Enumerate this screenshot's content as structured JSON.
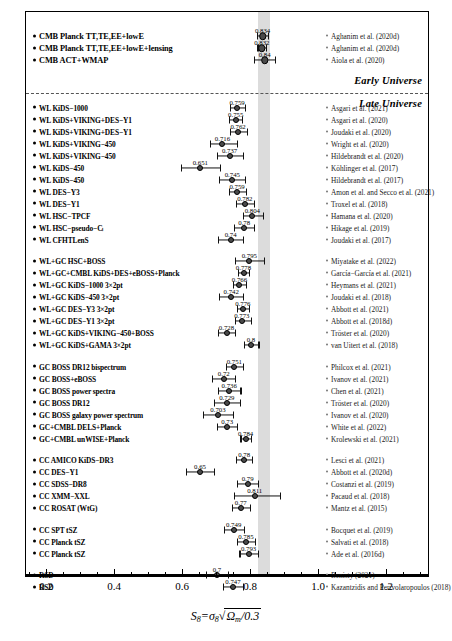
{
  "figure": {
    "xlabel_main": "S",
    "xlabel_sub": "8",
    "xlabel_eq": "=",
    "xlabel_sigma": "σ",
    "xlabel_sigma_sub": "8",
    "xlabel_radicand": "Ω",
    "xlabel_radicand_sub": "m",
    "xlabel_radicand_rest": "/0.3",
    "era_early": "Early Universe",
    "era_late": "Late Universe",
    "band_label": "CMB Planck band",
    "band_color": "#cfcfcf"
  },
  "axis": {
    "labels": [
      "0.2",
      "0.4",
      "0.6",
      "0.8",
      "1.0",
      "1.2"
    ],
    "values": [
      0.2,
      0.4,
      0.6,
      0.8,
      1.0,
      1.2
    ],
    "min": 0.13,
    "max": 1.32,
    "minor_step": 0.05
  },
  "chart_data": {
    "type": "scatter",
    "title": "",
    "xlabel": "S8 = sigma8 sqrt(Omega_m/0.3)",
    "ylabel": "",
    "xlim": [
      0.13,
      1.32
    ],
    "grid": false,
    "legend": "none",
    "band": {
      "low": 0.82,
      "high": 0.855
    },
    "groups": [
      {
        "name": "CMB",
        "era": "early",
        "points": [
          {
            "label": "CMB Planck TT,TE,EE+lowE",
            "value": 0.834,
            "value_text": "0.834",
            "err_low": 0.016,
            "err_high": 0.016,
            "ref": "Aghanim et al. (2020d)"
          },
          {
            "label": "CMB Planck TT,TE,EE+lowE+lensing",
            "value": 0.832,
            "value_text": "0.832",
            "err_low": 0.013,
            "err_high": 0.013,
            "ref": "Aghanim et al. (2020d)"
          },
          {
            "label": "CMB ACT+WMAP",
            "value": 0.84,
            "value_text": "0.84",
            "err_low": 0.03,
            "err_high": 0.03,
            "ref": "Aiola et al. (2020)"
          }
        ]
      },
      {
        "name": "WL",
        "era": "late",
        "points": [
          {
            "label": "WL KiDS−1000",
            "value": 0.759,
            "value_text": "0.759",
            "err_low": 0.021,
            "err_high": 0.024,
            "ref": "Asgari et al. (2021)"
          },
          {
            "label": "WL KiDS+VIKING+DES−Y1",
            "value": 0.755,
            "value_text": "0.755",
            "err_low": 0.021,
            "err_high": 0.019,
            "ref": "Asgari et al. (2020)"
          },
          {
            "label": "WL KiDS+VIKING+DES−Y1",
            "value": 0.762,
            "value_text": "0.762",
            "err_low": 0.024,
            "err_high": 0.025,
            "ref": "Joudaki et al. (2020)"
          },
          {
            "label": "WL KiDS+VIKING−450",
            "value": 0.716,
            "value_text": "0.716",
            "err_low": 0.038,
            "err_high": 0.043,
            "ref": "Wright et al. (2020)"
          },
          {
            "label": "WL KiDS+VIKING−450",
            "value": 0.737,
            "value_text": "0.737",
            "err_low": 0.036,
            "err_high": 0.04,
            "ref": "Hildebrandt et al. (2020)"
          },
          {
            "label": "WL KiDS−450",
            "value": 0.651,
            "value_text": "0.651",
            "err_low": 0.058,
            "err_high": 0.058,
            "ref": "Köhlinger et al. (2017)"
          },
          {
            "label": "WL KiDS−450",
            "value": 0.745,
            "value_text": "0.745",
            "err_low": 0.038,
            "err_high": 0.038,
            "ref": "Hildebrandt et al. (2017)"
          },
          {
            "label": "WL DES−Y3",
            "value": 0.759,
            "value_text": "0.759",
            "err_low": 0.023,
            "err_high": 0.025,
            "ref": "Amon et al. and Secco et al. (2021)"
          },
          {
            "label": "WL DES−Y1",
            "value": 0.782,
            "value_text": "0.782",
            "err_low": 0.027,
            "err_high": 0.027,
            "ref": "Troxel et al. (2018)"
          },
          {
            "label": "WL HSC−TPCF",
            "value": 0.804,
            "value_text": "0.804",
            "err_low": 0.029,
            "err_high": 0.032,
            "ref": "Hamana et al. (2020)"
          },
          {
            "label": "WL HSC−pseudo−Cₗ",
            "value": 0.78,
            "value_text": "0.78",
            "err_low": 0.03,
            "err_high": 0.03,
            "ref": "Hikage et al. (2019)"
          },
          {
            "label": "WL CFHTLenS",
            "value": 0.74,
            "value_text": "0.74",
            "err_low": 0.037,
            "err_high": 0.037,
            "ref": "Joudaki et al. (2017)"
          }
        ]
      },
      {
        "name": "WL+GC",
        "era": "late",
        "points": [
          {
            "label": "WL+GC HSC+BOSS",
            "value": 0.795,
            "value_text": "0.795",
            "err_low": 0.042,
            "err_high": 0.042,
            "ref": "Miyatake et al. (2022)"
          },
          {
            "label": "WL+GC+CMBL KiDS+DES+eBOSS+Planck",
            "value": 0.778,
            "value_text": "0.778",
            "err_low": 0.017,
            "err_high": 0.016,
            "ref": "García−García et al. (2021)"
          },
          {
            "label": "WL+GC KiDS−1000 3×2pt",
            "value": 0.766,
            "value_text": "0.766",
            "err_low": 0.018,
            "err_high": 0.02,
            "ref": "Heymans et al. (2021)"
          },
          {
            "label": "WL+GC KiDS−450 3×2pt",
            "value": 0.742,
            "value_text": "0.742",
            "err_low": 0.035,
            "err_high": 0.035,
            "ref": "Joudaki et al. (2018)"
          },
          {
            "label": "WL+GC DES−Y3 3×2pt",
            "value": 0.776,
            "value_text": "0.776",
            "err_low": 0.017,
            "err_high": 0.017,
            "ref": "Abbott et al. (2021)"
          },
          {
            "label": "WL+GC DES−Y1 3×2pt",
            "value": 0.773,
            "value_text": "0.773",
            "err_low": 0.02,
            "err_high": 0.026,
            "ref": "Abbott et al. (2018d)"
          },
          {
            "label": "WL+GC KiDS+VIKING−450+BOSS",
            "value": 0.728,
            "value_text": "0.728",
            "err_low": 0.026,
            "err_high": 0.026,
            "ref": "Tröster et al. (2020)"
          },
          {
            "label": "WL+GC KiDS+GAMA 3×2pt",
            "value": 0.8,
            "value_text": "0.8",
            "err_low": 0.022,
            "err_high": 0.022,
            "ref": "van Uitert et al. (2018)"
          }
        ]
      },
      {
        "name": "GC",
        "era": "late",
        "points": [
          {
            "label": "GC BOSS DR12 bispectrum",
            "value": 0.751,
            "value_text": "0.751",
            "err_low": 0.026,
            "err_high": 0.026,
            "ref": "Philcox et al. (2021)"
          },
          {
            "label": "GC BOSS+eBOSS",
            "value": 0.72,
            "value_text": "0.72",
            "err_low": 0.034,
            "err_high": 0.034,
            "ref": "Ivanov et al. (2021)"
          },
          {
            "label": "GC BOSS power spectra",
            "value": 0.736,
            "value_text": "0.736",
            "err_low": 0.033,
            "err_high": 0.033,
            "ref": "Chen et al. (2021)"
          },
          {
            "label": "GC BOSS DR12",
            "value": 0.729,
            "value_text": "0.729",
            "err_low": 0.039,
            "err_high": 0.039,
            "ref": "Tröster et al. (2020)"
          },
          {
            "label": "GC BOSS galaxy power spectrum",
            "value": 0.703,
            "value_text": "0.703",
            "err_low": 0.045,
            "err_high": 0.045,
            "ref": "Ivanov et al. (2020)"
          },
          {
            "label": "GC+CMBL DELS+Planck",
            "value": 0.73,
            "value_text": "0.73",
            "err_low": 0.029,
            "err_high": 0.029,
            "ref": "White et al. (2022)"
          },
          {
            "label": "GC+CMBL unWISE+Planck",
            "value": 0.784,
            "value_text": "0.784",
            "err_low": 0.015,
            "err_high": 0.015,
            "ref": "Krolewski et al. (2021)"
          }
        ]
      },
      {
        "name": "CC",
        "era": "late",
        "points": [
          {
            "label": "CC AMICO KiDS−DR3",
            "value": 0.78,
            "value_text": "0.78",
            "err_low": 0.024,
            "err_high": 0.023,
            "ref": "Lesci et al. (2021)"
          },
          {
            "label": "CC DES−Y1",
            "value": 0.65,
            "value_text": "0.65",
            "err_low": 0.04,
            "err_high": 0.042,
            "ref": "Abbott et al. (2020d)"
          },
          {
            "label": "CC SDSS−DR8",
            "value": 0.79,
            "value_text": "0.79",
            "err_low": 0.031,
            "err_high": 0.031,
            "ref": "Costanzi et al. (2019)"
          },
          {
            "label": "CC XMM−XXL",
            "value": 0.811,
            "value_text": "0.811",
            "err_low": 0.062,
            "err_high": 0.075,
            "ref": "Pacaud et al. (2018)"
          },
          {
            "label": "CC ROSAT (WtG)",
            "value": 0.77,
            "value_text": "0.77",
            "err_low": 0.026,
            "err_high": 0.026,
            "ref": "Mantz et al. (2015)"
          }
        ]
      },
      {
        "name": "CC tSZ",
        "era": "late",
        "points": [
          {
            "label": "CC SPT tSZ",
            "value": 0.749,
            "value_text": "0.749",
            "err_low": 0.029,
            "err_high": 0.029,
            "ref": "Bocquet et al. (2019)"
          },
          {
            "label": "CC Planck tSZ",
            "value": 0.785,
            "value_text": "0.785",
            "err_low": 0.027,
            "err_high": 0.027,
            "ref": "Salvati et al. (2018)"
          },
          {
            "label": "CC Planck tSZ",
            "value": 0.793,
            "value_text": "0.793",
            "err_low": 0.027,
            "err_high": 0.027,
            "ref": "Ade et al. (2016d)"
          }
        ]
      },
      {
        "name": "RSD",
        "era": "late",
        "points": [
          {
            "label": "RSD",
            "value": 0.7,
            "value_text": "0.7",
            "err_low": 0.032,
            "err_high": 0.032,
            "ref": "Benisty (2021)"
          },
          {
            "label": "RSD",
            "value": 0.747,
            "value_text": "0.747",
            "err_low": 0.03,
            "err_high": 0.03,
            "ref": "Kazantzidis and Perivolaropoulos (2018)"
          }
        ]
      }
    ]
  }
}
